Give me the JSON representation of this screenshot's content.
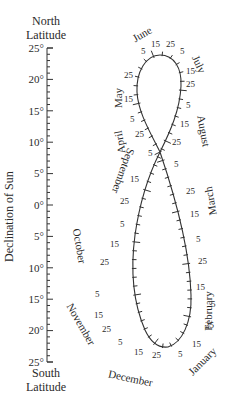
{
  "axis": {
    "top_title_line1": "North",
    "top_title_line2": "Latitude",
    "bottom_title_line1": "South",
    "bottom_title_line2": "Latitude",
    "ylabel": "Declination of Sun",
    "ticks": [
      "25°",
      "20°",
      "15°",
      "10°",
      "5°",
      "0°",
      "5°",
      "10°",
      "15°",
      "20°",
      "25°"
    ]
  },
  "months": {
    "june": "June",
    "july": "July",
    "may": "May",
    "august": "August",
    "april": "April",
    "september": "September",
    "march": "March",
    "october": "October",
    "february": "February",
    "november": "November",
    "december": "December",
    "january": "January"
  },
  "day_labels": {
    "d5": "5",
    "d15": "15",
    "d25": "25"
  },
  "chart_data": {
    "type": "analemma",
    "ylabel": "Declination of Sun",
    "ylim": [
      -25,
      25
    ],
    "y_ticks": [
      25,
      20,
      15,
      10,
      5,
      0,
      -5,
      -10,
      -15,
      -20,
      -25
    ],
    "top_label": "North Latitude",
    "bottom_label": "South Latitude",
    "date_marks": [
      "5",
      "15",
      "25"
    ],
    "months": [
      "January",
      "February",
      "March",
      "April",
      "May",
      "June",
      "July",
      "August",
      "September",
      "October",
      "November",
      "December"
    ]
  }
}
